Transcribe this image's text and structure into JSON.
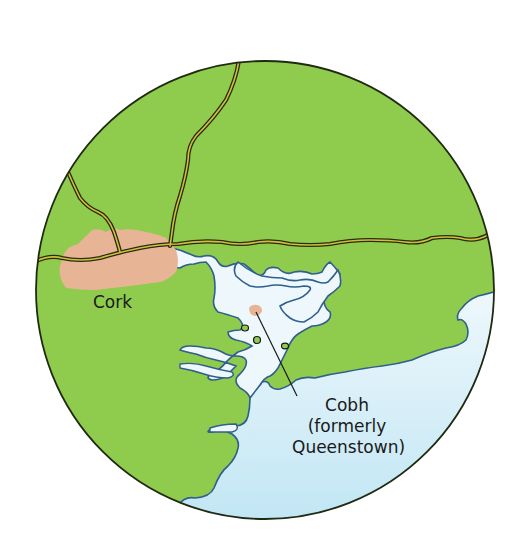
{
  "map": {
    "labels": {
      "cork": "Cork",
      "cobh_line1": "Cobh",
      "cobh_line2": "(formerly",
      "cobh_line3": "Queenstown)"
    },
    "colors": {
      "land": "#8fcb4c",
      "town": "#e7b595",
      "water_inner": "#eef8fc",
      "water_outer": "#bfe5f4",
      "coastline": "#2f5f8e",
      "road_fill": "#c9b53a",
      "road_casing": "#2a2a10",
      "circle_border": "#1f2a12",
      "background": "#ffffff"
    },
    "features": [
      "circular-map-frame",
      "cork-city-area",
      "cobh-town-marker",
      "cork-harbour",
      "roads",
      "leader-line"
    ]
  }
}
